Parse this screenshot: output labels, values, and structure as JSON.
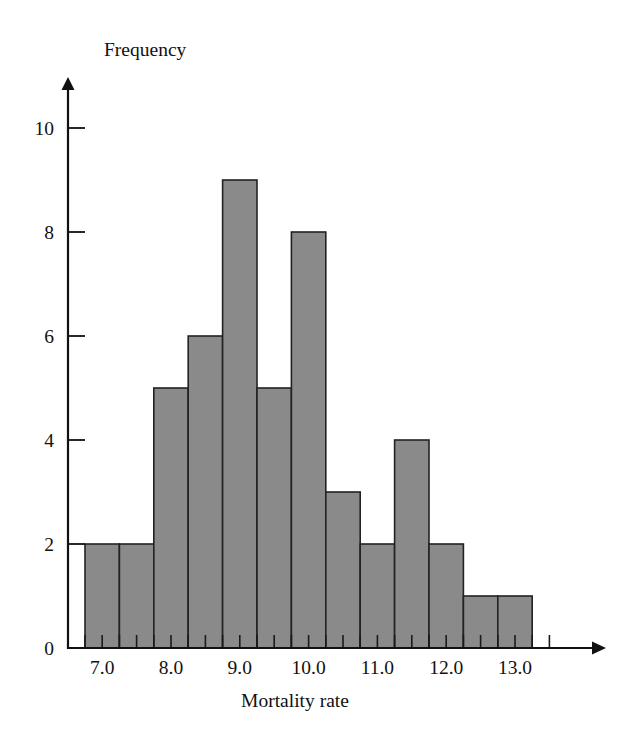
{
  "chart_data": {
    "type": "bar",
    "title": "",
    "subtitle": "",
    "xlabel": "Mortality rate",
    "ylabel": "Frequency",
    "grid": false,
    "legend": null,
    "bin_width": 0.5,
    "x_bin_edges": [
      6.75,
      7.25,
      7.75,
      8.25,
      8.75,
      9.25,
      9.75,
      10.25,
      10.75,
      11.25,
      11.75,
      12.25,
      12.75,
      13.25
    ],
    "categories": [
      "6.75-7.25",
      "7.25-7.75",
      "7.75-8.25",
      "8.25-8.75",
      "8.75-9.25",
      "9.25-9.75",
      "9.75-10.25",
      "10.25-10.75",
      "10.75-11.25",
      "11.25-11.75",
      "11.75-12.25",
      "12.25-12.75",
      "12.75-13.25"
    ],
    "values": [
      2,
      2,
      5,
      6,
      9,
      5,
      8,
      3,
      2,
      4,
      2,
      1,
      1
    ],
    "xlim": [
      6.65,
      13.85
    ],
    "ylim": [
      0,
      10.8
    ],
    "x_ticks_major": [
      7.0,
      8.0,
      9.0,
      10.0,
      11.0,
      12.0,
      13.0
    ],
    "x_tick_labels": [
      "7.0",
      "8.0",
      "9.0",
      "10.0",
      "11.0",
      "12.0",
      "13.0"
    ],
    "x_ticks_minor": [
      6.75,
      7.25,
      7.5,
      7.75,
      8.25,
      8.5,
      8.75,
      9.25,
      9.5,
      9.75,
      10.25,
      10.5,
      10.75,
      11.25,
      11.5,
      11.75,
      12.25,
      12.5,
      12.75,
      13.25,
      13.5
    ],
    "y_ticks": [
      0,
      2,
      4,
      6,
      8,
      10
    ],
    "y_tick_labels": [
      "0",
      "2",
      "4",
      "6",
      "8",
      "10"
    ],
    "bar_fill_color": "#8a8a8a",
    "bar_edge_color": "#222222",
    "axis_color": "#111111",
    "background_color": "#ffffff",
    "total_count": 42
  }
}
